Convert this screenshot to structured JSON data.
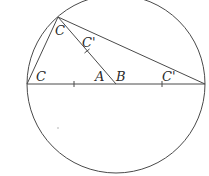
{
  "diagram": {
    "colors": {
      "stroke": "#4a4a4a",
      "text": "#2a2a2a",
      "background": "#ffffff"
    },
    "circle": {
      "cx": 116,
      "cy": 84,
      "r": 89
    },
    "points": {
      "left_end": {
        "x": 27,
        "y": 84
      },
      "right_end": {
        "x": 205,
        "y": 84
      },
      "apex": {
        "x": 58,
        "y": 17
      },
      "center_B": {
        "x": 116,
        "y": 84
      }
    },
    "labels": {
      "apex_angle": "C",
      "median_mark": "C'",
      "left_angle": "C",
      "point_A": "A",
      "point_B": "B",
      "right_mark": "C'"
    },
    "tick_marks": [
      {
        "on": "diameter-left-half",
        "x": 74,
        "y": 84
      },
      {
        "on": "diameter-right-half",
        "x": 162,
        "y": 84
      },
      {
        "on": "apex-to-center",
        "x": 87,
        "y": 51
      }
    ]
  }
}
